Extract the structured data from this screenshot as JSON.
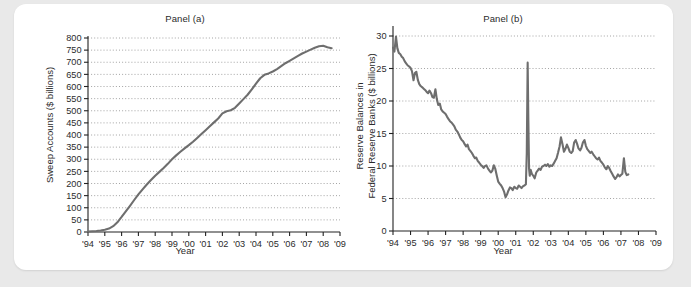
{
  "figure": {
    "background_color": "#e9e9e9",
    "card_color": "#ffffff",
    "series_color": "#6e6e6e",
    "grid_color": "#8d8d8d",
    "axis_color": "#222222"
  },
  "panel_a": {
    "title": "Panel (a)",
    "ylabel": "Sweep Accounts ($ billions)",
    "xlabel": "Year"
  },
  "panel_b": {
    "title": "Panel (b)",
    "ylabel_line1": "Reserve Balances in",
    "ylabel_line2": "Federal Reserve Banks ($ billions)",
    "xlabel": "Year"
  },
  "chart_data": [
    {
      "type": "line",
      "title": "Panel (a)",
      "xlabel": "Year",
      "ylabel": "Sweep Accounts ($ billions)",
      "grid": true,
      "legend": "none",
      "xlim": [
        1994,
        2009
      ],
      "ylim": [
        0,
        800
      ],
      "ytick_labels": [
        "0",
        "50",
        "100",
        "150",
        "200",
        "250",
        "300",
        "350",
        "400",
        "450",
        "500",
        "550",
        "600",
        "650",
        "700",
        "750",
        "800"
      ],
      "ytick_values": [
        0,
        50,
        100,
        150,
        200,
        250,
        300,
        350,
        400,
        450,
        500,
        550,
        600,
        650,
        700,
        750,
        800
      ],
      "xtick_labels": [
        "'94",
        "'95",
        "'96",
        "'97",
        "'98",
        "'99",
        "'00",
        "'01",
        "'02",
        "'03",
        "'04",
        "'05",
        "'06",
        "'07",
        "'08",
        "'09"
      ],
      "xtick_values": [
        1994,
        1995,
        1996,
        1997,
        1998,
        1999,
        2000,
        2001,
        2002,
        2003,
        2004,
        2005,
        2006,
        2007,
        2008,
        2009
      ],
      "series": [
        {
          "name": "Sweep Accounts",
          "x": [
            1994.0,
            1994.25,
            1994.5,
            1994.75,
            1995.0,
            1995.25,
            1995.5,
            1995.75,
            1996.0,
            1996.25,
            1996.5,
            1996.75,
            1997.0,
            1997.25,
            1997.5,
            1997.75,
            1998.0,
            1998.25,
            1998.5,
            1998.75,
            1999.0,
            1999.25,
            1999.5,
            1999.75,
            2000.0,
            2000.25,
            2000.5,
            2000.75,
            2001.0,
            2001.25,
            2001.5,
            2001.75,
            2002.0,
            2002.25,
            2002.5,
            2002.75,
            2003.0,
            2003.25,
            2003.5,
            2003.75,
            2004.0,
            2004.25,
            2004.5,
            2004.75,
            2005.0,
            2005.25,
            2005.5,
            2005.75,
            2006.0,
            2006.25,
            2006.5,
            2006.75,
            2007.0,
            2007.25,
            2007.5,
            2007.75,
            2008.0,
            2008.25,
            2008.5
          ],
          "values": [
            2,
            3,
            4,
            6,
            9,
            14,
            24,
            40,
            62,
            85,
            108,
            132,
            155,
            176,
            196,
            214,
            232,
            248,
            264,
            281,
            300,
            316,
            331,
            345,
            358,
            372,
            388,
            404,
            420,
            436,
            452,
            468,
            489,
            498,
            502,
            512,
            530,
            548,
            566,
            588,
            612,
            634,
            648,
            654,
            662,
            672,
            684,
            696,
            706,
            716,
            726,
            736,
            744,
            752,
            760,
            766,
            768,
            762,
            758
          ]
        }
      ]
    },
    {
      "type": "line",
      "title": "Panel (b)",
      "xlabel": "Year",
      "ylabel": "Reserve Balances in Federal Reserve Banks ($ billions)",
      "grid": true,
      "legend": "none",
      "xlim": [
        1994,
        2009
      ],
      "ylim": [
        0,
        30
      ],
      "ytick_labels": [
        "0",
        "5",
        "10",
        "15",
        "20",
        "25",
        "30"
      ],
      "ytick_values": [
        0,
        5,
        10,
        15,
        20,
        25,
        30
      ],
      "xtick_labels": [
        "'94",
        "'95",
        "'96",
        "'97",
        "'98",
        "'99",
        "'00",
        "'01",
        "'02",
        "'03",
        "'04",
        "'05",
        "'06",
        "'07",
        "'08",
        "'09"
      ],
      "xtick_values": [
        1994,
        1995,
        1996,
        1997,
        1998,
        1999,
        2000,
        2001,
        2002,
        2003,
        2004,
        2005,
        2006,
        2007,
        2008,
        2009
      ],
      "annotations": [
        {
          "label": "September 2001 spike",
          "x": 2001.7,
          "y": 25.9
        }
      ],
      "series": [
        {
          "name": "Reserve Balances",
          "x": [
            1994.0,
            1994.08,
            1994.17,
            1994.25,
            1994.33,
            1994.42,
            1994.5,
            1994.58,
            1994.67,
            1994.75,
            1994.83,
            1994.92,
            1995.0,
            1995.08,
            1995.17,
            1995.25,
            1995.33,
            1995.42,
            1995.5,
            1995.58,
            1995.67,
            1995.75,
            1995.83,
            1995.92,
            1996.0,
            1996.08,
            1996.17,
            1996.25,
            1996.33,
            1996.42,
            1996.5,
            1996.58,
            1996.67,
            1996.75,
            1996.83,
            1996.92,
            1997.0,
            1997.08,
            1997.17,
            1997.25,
            1997.33,
            1997.42,
            1997.5,
            1997.58,
            1997.67,
            1997.75,
            1997.83,
            1997.92,
            1998.0,
            1998.08,
            1998.17,
            1998.25,
            1998.33,
            1998.42,
            1998.5,
            1998.58,
            1998.67,
            1998.75,
            1998.83,
            1998.92,
            1999.0,
            1999.08,
            1999.17,
            1999.25,
            1999.33,
            1999.42,
            1999.5,
            1999.58,
            1999.67,
            1999.75,
            1999.83,
            1999.92,
            2000.0,
            2000.08,
            2000.17,
            2000.25,
            2000.33,
            2000.42,
            2000.5,
            2000.58,
            2000.67,
            2000.75,
            2000.83,
            2000.92,
            2001.0,
            2001.08,
            2001.17,
            2001.25,
            2001.33,
            2001.42,
            2001.5,
            2001.58,
            2001.63,
            2001.68,
            2001.72,
            2001.76,
            2001.8,
            2001.85,
            2001.92,
            2002.0,
            2002.08,
            2002.17,
            2002.25,
            2002.33,
            2002.42,
            2002.5,
            2002.58,
            2002.67,
            2002.75,
            2002.83,
            2002.92,
            2003.0,
            2003.08,
            2003.17,
            2003.25,
            2003.33,
            2003.42,
            2003.5,
            2003.58,
            2003.67,
            2003.75,
            2003.83,
            2003.92,
            2004.0,
            2004.08,
            2004.17,
            2004.25,
            2004.33,
            2004.42,
            2004.5,
            2004.58,
            2004.67,
            2004.75,
            2004.83,
            2004.92,
            2005.0,
            2005.08,
            2005.17,
            2005.25,
            2005.33,
            2005.42,
            2005.5,
            2005.58,
            2005.67,
            2005.75,
            2005.83,
            2005.92,
            2006.0,
            2006.08,
            2006.17,
            2006.25,
            2006.33,
            2006.42,
            2006.5,
            2006.58,
            2006.67,
            2006.75,
            2006.83,
            2006.92,
            2007.0,
            2007.08,
            2007.17,
            2007.25,
            2007.33,
            2007.42,
            2007.5,
            2007.58
          ],
          "values": [
            28.2,
            27.6,
            29.9,
            28.1,
            27.4,
            27.2,
            26.8,
            26.6,
            26.1,
            25.8,
            25.5,
            25.3,
            25.1,
            24.6,
            23.2,
            24.3,
            24.5,
            23.2,
            22.6,
            22.3,
            22.1,
            21.9,
            21.7,
            21.4,
            21.2,
            21.6,
            21.2,
            20.6,
            20.5,
            21.8,
            20.3,
            19.4,
            19.6,
            18.7,
            18.4,
            18.2,
            18.0,
            17.6,
            17.2,
            16.9,
            16.7,
            16.4,
            16.1,
            15.6,
            15.3,
            14.9,
            14.4,
            14.0,
            13.8,
            13.4,
            13.0,
            13.3,
            12.6,
            12.3,
            12.0,
            11.6,
            11.2,
            11.3,
            10.8,
            10.5,
            10.2,
            10.0,
            9.7,
            10.0,
            10.1,
            9.6,
            9.3,
            9.0,
            9.3,
            10.1,
            9.6,
            8.5,
            7.6,
            7.3,
            7.0,
            6.6,
            6.1,
            5.2,
            5.6,
            6.2,
            6.7,
            6.6,
            6.3,
            6.8,
            6.6,
            6.5,
            7.0,
            6.8,
            6.6,
            6.9,
            7.0,
            7.2,
            12.0,
            25.9,
            17.0,
            9.6,
            8.5,
            9.4,
            8.8,
            8.5,
            8.1,
            9.0,
            9.3,
            9.6,
            9.4,
            9.9,
            10.0,
            10.2,
            10.0,
            10.3,
            9.9,
            10.1,
            10.0,
            10.4,
            10.8,
            11.2,
            12.1,
            13.0,
            14.4,
            13.3,
            12.2,
            12.6,
            13.3,
            12.8,
            12.2,
            12.0,
            12.3,
            13.6,
            14.0,
            13.4,
            12.7,
            12.4,
            12.8,
            13.6,
            14.0,
            13.1,
            12.6,
            12.3,
            12.0,
            12.2,
            11.8,
            11.5,
            11.2,
            11.0,
            11.3,
            10.8,
            10.5,
            10.2,
            9.8,
            9.5,
            10.0,
            9.7,
            9.2,
            8.8,
            8.4,
            8.0,
            8.3,
            8.7,
            8.4,
            8.6,
            8.8,
            11.2,
            9.1,
            8.6,
            8.7
          ]
        }
      ]
    }
  ]
}
